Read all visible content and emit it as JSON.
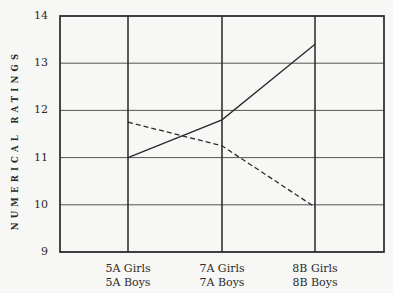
{
  "chart_data": {
    "type": "line",
    "title": "",
    "xlabel": "",
    "ylabel": "NUMERICAL RATINGS",
    "categories": [
      "5A",
      "7A",
      "8B"
    ],
    "x_tick_labels": [
      {
        "line1": "5A Girls",
        "line2": "5A Boys"
      },
      {
        "line1": "7A Girls",
        "line2": "7A Boys"
      },
      {
        "line1": "8B Girls",
        "line2": "8B Boys"
      }
    ],
    "ylim": [
      9,
      14
    ],
    "y_ticks": [
      "9",
      "10",
      "11",
      "12",
      "13",
      "14"
    ],
    "grid": true,
    "legend": "none (series distinguished by line style)",
    "series": [
      {
        "name": "Girls",
        "style": "solid",
        "values": [
          11.0,
          11.8,
          13.4
        ]
      },
      {
        "name": "Boys",
        "style": "dashed",
        "values": [
          11.75,
          11.25,
          9.95
        ]
      }
    ]
  },
  "colors": {
    "line": "#2a2a2a",
    "grid": "#555555",
    "background": "#f7f7f5"
  }
}
